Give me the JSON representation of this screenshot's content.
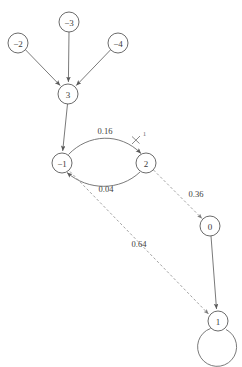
{
  "diagram": {
    "type": "directed-graph",
    "title": "",
    "nodes": [
      {
        "id": "n_minus2",
        "label": "−2",
        "cx": 18,
        "cy": 43,
        "r": 10
      },
      {
        "id": "n_minus3",
        "label": "−3",
        "cx": 69,
        "cy": 22,
        "r": 10
      },
      {
        "id": "n_minus4",
        "label": "−4",
        "cx": 118,
        "cy": 43,
        "r": 10
      },
      {
        "id": "n_3",
        "label": "3",
        "cx": 68,
        "cy": 94,
        "r": 10
      },
      {
        "id": "n_minus1",
        "label": "−1",
        "cx": 62,
        "cy": 163,
        "r": 10
      },
      {
        "id": "n_2",
        "label": "2",
        "cx": 146,
        "cy": 163,
        "r": 10
      },
      {
        "id": "n_0",
        "label": "0",
        "cx": 210,
        "cy": 226,
        "r": 10
      },
      {
        "id": "n_1",
        "label": "1",
        "cx": 218,
        "cy": 321,
        "r": 10
      }
    ],
    "edges": [
      {
        "id": "e_m2_3",
        "from": "−2",
        "to": "3",
        "style": "solid",
        "label": ""
      },
      {
        "id": "e_m3_3",
        "from": "−3",
        "to": "3",
        "style": "solid",
        "label": ""
      },
      {
        "id": "e_m4_3",
        "from": "−4",
        "to": "3",
        "style": "solid",
        "label": ""
      },
      {
        "id": "e_3_m1",
        "from": "3",
        "to": "−1",
        "style": "solid",
        "label": ""
      },
      {
        "id": "e_m1_2",
        "from": "−1",
        "to": "2",
        "style": "solid",
        "label": "0.16"
      },
      {
        "id": "e_2_m1",
        "from": "2",
        "to": "−1",
        "style": "solid",
        "label": "0.04"
      },
      {
        "id": "e_2_0",
        "from": "2",
        "to": "0",
        "style": "dashed",
        "label": "0.36"
      },
      {
        "id": "e_m1_1",
        "from": "−1",
        "to": "1",
        "style": "dashed",
        "label": "0.64"
      },
      {
        "id": "e_0_1",
        "from": "0",
        "to": "1",
        "style": "solid",
        "label": ""
      },
      {
        "id": "e_1_1",
        "from": "1",
        "to": "1",
        "style": "solid",
        "label": ""
      }
    ],
    "annotations": [
      {
        "id": "tick_1",
        "label": "1",
        "x": 143,
        "y": 133
      }
    ],
    "colors": {
      "node_stroke": "#5a5a5a",
      "edge_solid": "#6b6b6b",
      "edge_dashed": "#8c8c8c",
      "text": "#3b3b3b",
      "background": "#ffffff"
    }
  }
}
